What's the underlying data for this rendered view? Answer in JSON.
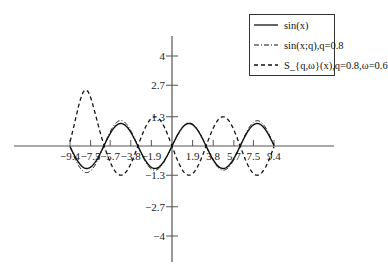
{
  "chart_data": {
    "type": "line",
    "title": "",
    "xlabel": "",
    "ylabel": "",
    "x_ticks": [
      -9.4,
      -7.5,
      -5.7,
      -3.8,
      -1.9,
      1.9,
      3.8,
      5.7,
      7.5,
      9.4
    ],
    "x_tick_labels": [
      "-9.4",
      "-7.5",
      "-5.7",
      "-3.8",
      "-1.9",
      "1.9",
      "3.8",
      "5.7",
      "7.5",
      "9.4"
    ],
    "y_ticks": [
      4,
      2.7,
      1.3,
      -1.3,
      -2.7,
      -4
    ],
    "y_tick_labels": [
      "4",
      "2.7",
      "1.3",
      "-1.3",
      "-2.7",
      "-4"
    ],
    "xlim": [
      -9.4,
      9.4
    ],
    "ylim": [
      -5,
      5
    ],
    "grid": false,
    "legend_position": "upper right",
    "series": [
      {
        "name": "sin(x)",
        "style": "solid",
        "function": "sin(x)",
        "amplitude": 1.0
      },
      {
        "name": "sin(x;q), q=0.8",
        "style": "dash-dot",
        "function": "q-deformed sine",
        "amplitude_range": [
          0.9,
          1.3
        ]
      },
      {
        "name": "S_{q,ω}(x), q=0.8, ω=0.6",
        "style": "dashed",
        "peak_left": 2.5,
        "amplitude_typical": 1.3
      }
    ]
  },
  "legend": {
    "items": [
      {
        "label": "sin(x)",
        "style": "solid"
      },
      {
        "label": "sin(x;q),q=0.8",
        "style": "dash-dot"
      },
      {
        "label": "S_{q,ω}(x),q=0.8,ω=0.6",
        "style": "dashed"
      }
    ]
  }
}
